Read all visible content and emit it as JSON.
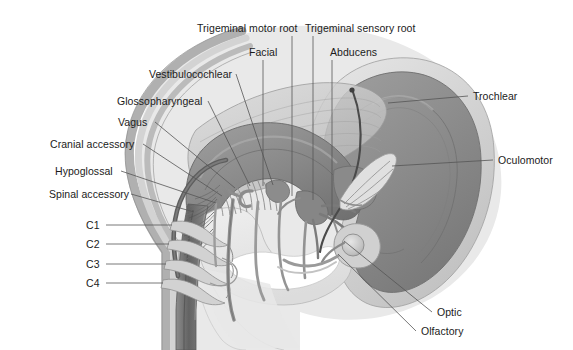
{
  "figure": {
    "style": "grayscale medical illustration",
    "background_color": "#ffffff",
    "text_color": "#1b1b1b",
    "leader_line_color": "#555555"
  },
  "palette": {
    "cerebrum_fill": "#8d8d8d",
    "cerebrum_inner": "#7e7e7e",
    "cerebrum_halo": "#c9c9c9",
    "cerebrum_halo_outer": "#dcdcdc",
    "brainstem_fill": "#8a8a8a",
    "cerebellum_translucent": "#cfcfcf",
    "dura_outer": "#b9b9b9",
    "dura_mid": "#d5d5d5",
    "spinal_cord": "#6f6f6f",
    "nerve_gray": "#9a9a9a",
    "nerve_dark": "#5e5e5e",
    "pale_tissue": "#e3e3e3",
    "white_matter": "#ffffff"
  },
  "labels": {
    "top": [
      {
        "id": "trigeminal-motor-root",
        "text": "Trigeminal motor root",
        "x": 197,
        "y": 23,
        "anchor": "start",
        "leader": {
          "x1": 292,
          "y1": 36,
          "x2": 292,
          "y2": 196
        }
      },
      {
        "id": "trigeminal-sensory-root",
        "text": "Trigeminal sensory root",
        "x": 305,
        "y": 23,
        "anchor": "start",
        "leader": {
          "x1": 313,
          "y1": 36,
          "x2": 313,
          "y2": 200
        }
      },
      {
        "id": "facial",
        "text": "Facial",
        "x": 249,
        "y": 47,
        "anchor": "start",
        "leader": {
          "x1": 263,
          "y1": 60,
          "x2": 263,
          "y2": 186
        }
      },
      {
        "id": "abducens",
        "text": "Abducens",
        "x": 330,
        "y": 47,
        "anchor": "start",
        "leader": {
          "x1": 332,
          "y1": 60,
          "x2": 332,
          "y2": 215
        }
      },
      {
        "id": "vestibulocochlear",
        "text": "Vestibulocochlear",
        "x": 149,
        "y": 69,
        "anchor": "start",
        "leader": {
          "x1": 236,
          "y1": 74,
          "x2": 273,
          "y2": 185
        }
      }
    ],
    "left": [
      {
        "id": "glossopharyngeal",
        "text": "Glossopharyngeal",
        "x": 117,
        "y": 96,
        "anchor": "start",
        "leader": {
          "x1": 208,
          "y1": 101,
          "x2": 250,
          "y2": 186
        }
      },
      {
        "id": "vagus",
        "text": "Vagus",
        "x": 118,
        "y": 117,
        "anchor": "start",
        "leader": {
          "x1": 155,
          "y1": 122,
          "x2": 235,
          "y2": 188
        }
      },
      {
        "id": "cranial-accessory",
        "text": "Cranial accessory",
        "x": 50,
        "y": 139,
        "anchor": "start",
        "leader": {
          "x1": 143,
          "y1": 144,
          "x2": 222,
          "y2": 196
        }
      },
      {
        "id": "hypoglossal",
        "text": "Hypoglossal",
        "x": 55,
        "y": 166,
        "anchor": "start",
        "leader": {
          "x1": 121,
          "y1": 171,
          "x2": 216,
          "y2": 203
        }
      },
      {
        "id": "spinal-accessory",
        "text": "Spinal accessory",
        "x": 49,
        "y": 189,
        "anchor": "start",
        "leader": {
          "x1": 131,
          "y1": 194,
          "x2": 194,
          "y2": 212
        }
      },
      {
        "id": "c1",
        "text": "C1",
        "x": 86,
        "y": 220,
        "anchor": "start",
        "leader": {
          "x1": 106,
          "y1": 225,
          "x2": 172,
          "y2": 225
        }
      },
      {
        "id": "c2",
        "text": "C2",
        "x": 86,
        "y": 239,
        "anchor": "start",
        "leader": {
          "x1": 106,
          "y1": 244,
          "x2": 169,
          "y2": 244
        }
      },
      {
        "id": "c3",
        "text": "C3",
        "x": 86,
        "y": 259,
        "anchor": "start",
        "leader": {
          "x1": 106,
          "y1": 264,
          "x2": 166,
          "y2": 264
        }
      },
      {
        "id": "c4",
        "text": "C4",
        "x": 86,
        "y": 278,
        "anchor": "start",
        "leader": {
          "x1": 106,
          "y1": 283,
          "x2": 163,
          "y2": 283
        }
      }
    ],
    "right": [
      {
        "id": "trochlear",
        "text": "Trochlear",
        "x": 473,
        "y": 91,
        "anchor": "start",
        "leader": {
          "x1": 468,
          "y1": 96,
          "x2": 388,
          "y2": 103
        }
      },
      {
        "id": "oculomotor",
        "text": "Oculomotor",
        "x": 498,
        "y": 155,
        "anchor": "start",
        "leader": {
          "x1": 493,
          "y1": 160,
          "x2": 392,
          "y2": 166
        }
      },
      {
        "id": "optic",
        "text": "Optic",
        "x": 437,
        "y": 307,
        "anchor": "start",
        "leader": {
          "x1": 432,
          "y1": 312,
          "x2": 344,
          "y2": 241
        }
      },
      {
        "id": "olfactory",
        "text": "Olfactory",
        "x": 421,
        "y": 326,
        "anchor": "start",
        "leader": {
          "x1": 416,
          "y1": 331,
          "x2": 338,
          "y2": 254
        }
      }
    ]
  },
  "nerve_list": {
    "cranial": [
      "Olfactory",
      "Optic",
      "Oculomotor",
      "Trochlear",
      "Trigeminal motor root",
      "Trigeminal sensory root",
      "Abducens",
      "Facial",
      "Vestibulocochlear",
      "Glossopharyngeal",
      "Vagus",
      "Cranial accessory",
      "Spinal accessory",
      "Hypoglossal"
    ],
    "spinal": [
      "C1",
      "C2",
      "C3",
      "C4"
    ]
  }
}
